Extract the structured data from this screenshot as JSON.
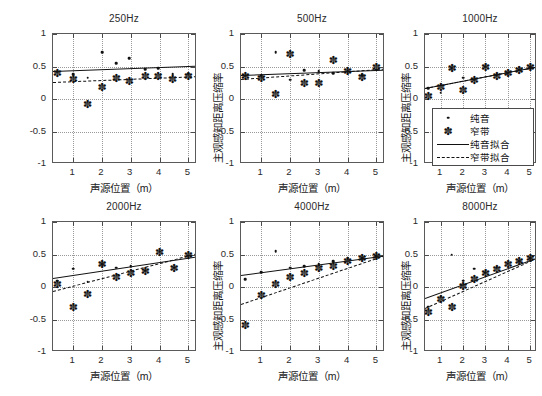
{
  "figure": {
    "rows": 2,
    "cols": 3,
    "axis_label_x": "声源位置（m）",
    "axis_label_y": "主观感知距离压缩率"
  },
  "legend": {
    "position": "inside 1000Hz subplot, lower-right",
    "items": [
      {
        "label": "纯音",
        "marker": "dot"
      },
      {
        "label": "窄带",
        "marker": "asterisk"
      },
      {
        "label": "纯音拟合",
        "marker": "solid-line"
      },
      {
        "label": "窄带拟合",
        "marker": "dashed-line"
      }
    ]
  },
  "axes": {
    "xlim": [
      0.3,
      5.3
    ],
    "ylim": [
      -1,
      1
    ],
    "xticks": [
      1,
      2,
      3,
      4,
      5
    ],
    "xticklabels": [
      "1",
      "2",
      "3",
      "4",
      "5"
    ],
    "yticks": [
      -1,
      -0.5,
      0,
      0.5,
      1
    ],
    "yticklabels": [
      "-1",
      "-0.5",
      "0",
      "0.5",
      "1"
    ],
    "grid": true
  },
  "colors": {
    "line": "#111111",
    "marker": "#111111",
    "frame": "#5a5a5a",
    "grid": "#9a9a9a",
    "background": "#ffffff"
  },
  "chart_data": [
    {
      "type": "scatter",
      "title": "250Hz",
      "xlabel": "声源位置（m）",
      "ylabel": "主观感知距离压缩率",
      "xlim": [
        0.3,
        5.3
      ],
      "ylim": [
        -1,
        1
      ],
      "xticks": [
        1,
        2,
        3,
        4,
        5
      ],
      "yticks": [
        -1,
        -0.5,
        0,
        0.5,
        1
      ],
      "grid": true,
      "series": [
        {
          "name": "纯音",
          "marker": "dot",
          "x": [
            0.45,
            1.0,
            1.5,
            2.0,
            2.5,
            2.95,
            3.5,
            3.95,
            4.45,
            5.0
          ],
          "y": [
            0.42,
            0.38,
            0.33,
            0.72,
            0.55,
            0.63,
            0.46,
            0.47,
            0.38,
            0.39
          ]
        },
        {
          "name": "窄带",
          "marker": "asterisk",
          "x": [
            0.45,
            1.0,
            1.5,
            2.0,
            2.5,
            2.95,
            3.5,
            3.95,
            4.45,
            5.0
          ],
          "y": [
            0.4,
            0.31,
            -0.07,
            0.18,
            0.33,
            0.28,
            0.36,
            0.36,
            0.31,
            0.36
          ]
        }
      ],
      "fits": [
        {
          "name": "纯音拟合",
          "style": "solid",
          "x": [
            0.3,
            5.3
          ],
          "y": [
            0.425,
            0.505
          ]
        },
        {
          "name": "窄带拟合",
          "style": "dashed",
          "x": [
            0.3,
            5.3
          ],
          "y": [
            0.255,
            0.345
          ]
        }
      ]
    },
    {
      "type": "scatter",
      "title": "500Hz",
      "xlabel": "声源位置（m）",
      "ylabel": "主观感知距离压缩率",
      "xlim": [
        0.3,
        5.3
      ],
      "ylim": [
        -1,
        1
      ],
      "xticks": [
        1,
        2,
        3,
        4,
        5
      ],
      "yticks": [
        -1,
        -0.5,
        0,
        0.5,
        1
      ],
      "grid": true,
      "series": [
        {
          "name": "纯音",
          "marker": "dot",
          "x": [
            0.45,
            1.0,
            1.5,
            2.0,
            2.5,
            3.0,
            3.5,
            4.0,
            4.5,
            5.0
          ],
          "y": [
            0.36,
            0.36,
            0.72,
            0.3,
            0.44,
            0.43,
            0.4,
            0.43,
            0.37,
            0.45
          ]
        },
        {
          "name": "窄带",
          "marker": "asterisk",
          "x": [
            0.45,
            1.0,
            1.5,
            2.0,
            2.5,
            3.0,
            3.5,
            4.0,
            4.5,
            5.0
          ],
          "y": [
            0.36,
            0.33,
            0.07,
            0.7,
            0.24,
            0.25,
            0.6,
            0.43,
            0.34,
            0.5
          ]
        }
      ],
      "fits": [
        {
          "name": "纯音拟合",
          "style": "solid",
          "x": [
            0.3,
            5.3
          ],
          "y": [
            0.375,
            0.455
          ]
        },
        {
          "name": "窄带拟合",
          "style": "dashed",
          "x": [
            0.3,
            5.3
          ],
          "y": [
            0.315,
            0.475
          ]
        }
      ]
    },
    {
      "type": "scatter",
      "title": "1000Hz",
      "xlabel": "声源位置（m）",
      "ylabel": "主观感知距离压缩率",
      "xlim": [
        0.3,
        5.3
      ],
      "ylim": [
        -1,
        1
      ],
      "xticks": [
        1,
        2,
        3,
        4,
        5
      ],
      "yticks": [
        -1,
        -0.5,
        0,
        0.5,
        1
      ],
      "grid": true,
      "series": [
        {
          "name": "纯音",
          "marker": "dot",
          "x": [
            0.45,
            1.0,
            1.5,
            2.0,
            2.5,
            3.0,
            3.5,
            4.0,
            4.5,
            5.0
          ],
          "y": [
            0.17,
            0.1,
            0.47,
            0.33,
            0.3,
            0.5,
            0.36,
            0.4,
            0.45,
            0.49
          ]
        },
        {
          "name": "窄带",
          "marker": "asterisk",
          "x": [
            0.45,
            1.0,
            1.5,
            2.0,
            2.5,
            3.0,
            3.5,
            4.0,
            4.5,
            5.0
          ],
          "y": [
            0.05,
            0.18,
            0.47,
            0.14,
            0.3,
            0.5,
            0.36,
            0.4,
            0.45,
            0.49
          ]
        }
      ],
      "fits": [
        {
          "name": "纯音拟合",
          "style": "solid",
          "x": [
            0.3,
            5.3
          ],
          "y": [
            0.175,
            0.505
          ]
        },
        {
          "name": "窄带拟合",
          "style": "dashed",
          "x": [
            0.3,
            5.3
          ],
          "y": [
            0.165,
            0.495
          ]
        }
      ]
    },
    {
      "type": "scatter",
      "title": "2000Hz",
      "xlabel": "声源位置（m）",
      "ylabel": "主观感知距离压缩率",
      "xlim": [
        0.3,
        5.3
      ],
      "ylim": [
        -1,
        1
      ],
      "xticks": [
        1,
        2,
        3,
        4,
        5
      ],
      "yticks": [
        -1,
        -0.5,
        0,
        0.5,
        1
      ],
      "grid": true,
      "series": [
        {
          "name": "纯音",
          "marker": "dot",
          "x": [
            0.45,
            1.0,
            1.5,
            2.0,
            2.5,
            3.0,
            3.5,
            4.0,
            4.5,
            5.0
          ],
          "y": [
            0.1,
            0.28,
            0.08,
            0.35,
            0.3,
            0.32,
            0.25,
            0.54,
            0.3,
            0.48
          ]
        },
        {
          "name": "窄带",
          "marker": "asterisk",
          "x": [
            0.45,
            1.0,
            1.5,
            2.0,
            2.5,
            3.0,
            3.5,
            4.0,
            4.5,
            5.0
          ],
          "y": [
            0.05,
            -0.3,
            -0.1,
            0.35,
            0.15,
            0.22,
            0.25,
            0.54,
            0.3,
            0.5
          ]
        }
      ],
      "fits": [
        {
          "name": "纯音拟合",
          "style": "solid",
          "x": [
            0.3,
            5.3
          ],
          "y": [
            0.135,
            0.465
          ]
        },
        {
          "name": "窄带拟合",
          "style": "dashed",
          "x": [
            0.3,
            5.3
          ],
          "y": [
            -0.055,
            0.525
          ]
        }
      ]
    },
    {
      "type": "scatter",
      "title": "4000Hz",
      "xlabel": "声源位置（m）",
      "ylabel": "主观感知距离压缩率",
      "xlim": [
        0.3,
        5.3
      ],
      "ylim": [
        -1,
        1
      ],
      "xticks": [
        1,
        2,
        3,
        4,
        5
      ],
      "yticks": [
        -1,
        -0.5,
        0,
        0.5,
        1
      ],
      "grid": true,
      "series": [
        {
          "name": "纯音",
          "marker": "dot",
          "x": [
            0.45,
            1.0,
            1.5,
            2.0,
            2.5,
            3.0,
            3.5,
            4.0,
            4.5,
            5.0
          ],
          "y": [
            0.12,
            0.23,
            0.55,
            0.3,
            0.32,
            0.36,
            0.4,
            0.44,
            0.44,
            0.47
          ]
        },
        {
          "name": "窄带",
          "marker": "asterisk",
          "x": [
            0.45,
            1.0,
            1.5,
            2.0,
            2.5,
            3.0,
            3.5,
            4.0,
            4.5,
            5.0
          ],
          "y": [
            -0.58,
            -0.12,
            0.05,
            0.15,
            0.22,
            0.3,
            0.33,
            0.4,
            0.44,
            0.47
          ]
        }
      ],
      "fits": [
        {
          "name": "纯音拟合",
          "style": "solid",
          "x": [
            0.3,
            5.3
          ],
          "y": [
            0.185,
            0.485
          ]
        },
        {
          "name": "窄带拟合",
          "style": "dashed",
          "x": [
            0.3,
            5.3
          ],
          "y": [
            -0.265,
            0.485
          ]
        }
      ]
    },
    {
      "type": "scatter",
      "title": "8000Hz",
      "xlabel": "声源位置（m）",
      "ylabel": "主观感知距离压缩率",
      "xlim": [
        0.3,
        5.3
      ],
      "ylim": [
        -1,
        1
      ],
      "xticks": [
        1,
        2,
        3,
        4,
        5
      ],
      "yticks": [
        -1,
        -0.5,
        0,
        0.5,
        1
      ],
      "grid": true,
      "series": [
        {
          "name": "纯音",
          "marker": "dot",
          "x": [
            0.45,
            1.0,
            1.5,
            2.0,
            2.5,
            3.0,
            3.5,
            4.0,
            4.5,
            5.0
          ],
          "y": [
            -0.3,
            -0.15,
            0.5,
            0.1,
            0.28,
            0.22,
            0.3,
            0.36,
            0.4,
            0.44
          ]
        },
        {
          "name": "窄带",
          "marker": "asterisk",
          "x": [
            0.45,
            1.0,
            1.5,
            2.0,
            2.5,
            3.0,
            3.5,
            4.0,
            4.5,
            5.0
          ],
          "y": [
            -0.38,
            -0.18,
            -0.3,
            0.02,
            0.12,
            0.22,
            0.28,
            0.36,
            0.4,
            0.44
          ]
        }
      ],
      "fits": [
        {
          "name": "纯音拟合",
          "style": "solid",
          "x": [
            0.3,
            5.3
          ],
          "y": [
            -0.175,
            0.445
          ]
        },
        {
          "name": "窄带拟合",
          "style": "dashed",
          "x": [
            0.3,
            5.3
          ],
          "y": [
            -0.325,
            0.445
          ]
        }
      ]
    }
  ]
}
